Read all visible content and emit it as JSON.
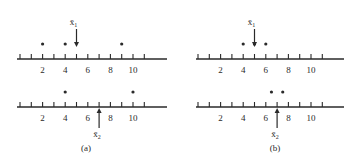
{
  "figure": {
    "panels": [
      {
        "id": "a",
        "caption": "(a)",
        "rows": [
          {
            "position": "top",
            "dots": [
              2,
              4,
              9
            ],
            "mean": {
              "label": "x̄",
              "subscript": "1",
              "value": 5,
              "arrow": "down-from-above"
            }
          },
          {
            "position": "bottom",
            "dots": [
              4,
              10
            ],
            "mean": {
              "label": "x̄",
              "subscript": "2",
              "value": 7,
              "arrow": "up-from-below"
            }
          }
        ]
      },
      {
        "id": "b",
        "caption": "(b)",
        "rows": [
          {
            "position": "top",
            "dots": [
              4,
              5,
              6
            ],
            "mean": {
              "label": "x̄",
              "subscript": "1",
              "value": 5,
              "arrow": "down-from-above"
            }
          },
          {
            "position": "bottom",
            "dots": [
              6.5,
              7.5
            ],
            "mean": {
              "label": "x̄",
              "subscript": "2",
              "value": 7,
              "arrow": "up-from-below"
            }
          }
        ]
      }
    ],
    "axis": {
      "tick_min": 0,
      "tick_max": 11,
      "tick_step": 1,
      "tick_labels": [
        "2",
        "4",
        "6",
        "8",
        "10"
      ],
      "tick_label_values": [
        2,
        4,
        6,
        8,
        10
      ]
    }
  }
}
